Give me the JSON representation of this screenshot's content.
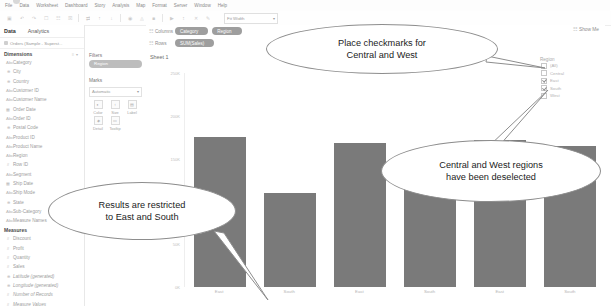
{
  "app": {
    "menu": [
      "File",
      "Data",
      "Worksheet",
      "Dashboard",
      "Story",
      "Analysis",
      "Map",
      "Format",
      "Server",
      "Window",
      "Help"
    ],
    "zoom_label": "Fit Width",
    "show_me": "Show Me",
    "show_me_icon": "grid-icon"
  },
  "left_panel": {
    "tab_data": "Data",
    "tab_analytics": "Analytics",
    "datasource": "Orders (Sample - Superst...",
    "dimensions_header": "Dimensions",
    "dimensions": [
      {
        "label": "Category",
        "icon": "abc-icon"
      },
      {
        "label": "City",
        "icon": "globe-icon"
      },
      {
        "label": "Country",
        "icon": "globe-icon"
      },
      {
        "label": "Customer ID",
        "icon": "abc-icon"
      },
      {
        "label": "Customer Name",
        "icon": "abc-icon"
      },
      {
        "label": "Order Date",
        "icon": "calendar-icon"
      },
      {
        "label": "Order ID",
        "icon": "abc-icon"
      },
      {
        "label": "Postal Code",
        "icon": "globe-icon"
      },
      {
        "label": "Product ID",
        "icon": "abc-icon"
      },
      {
        "label": "Product Name",
        "icon": "abc-icon"
      },
      {
        "label": "Region",
        "icon": "abc-icon"
      },
      {
        "label": "Row ID",
        "icon": "hash-icon"
      },
      {
        "label": "Segment",
        "icon": "abc-icon"
      },
      {
        "label": "Ship Date",
        "icon": "calendar-icon"
      },
      {
        "label": "Ship Mode",
        "icon": "abc-icon"
      },
      {
        "label": "State",
        "icon": "globe-icon"
      },
      {
        "label": "Sub-Category",
        "icon": "abc-icon"
      },
      {
        "label": "Measure Names",
        "icon": "abc-icon"
      }
    ],
    "measures_header": "Measures",
    "measures": [
      {
        "label": "Discount",
        "icon": "hash-icon",
        "italic": false
      },
      {
        "label": "Profit",
        "icon": "hash-icon",
        "italic": false
      },
      {
        "label": "Quantity",
        "icon": "hash-icon",
        "italic": false
      },
      {
        "label": "Sales",
        "icon": "hash-icon",
        "italic": false
      },
      {
        "label": "Latitude (generated)",
        "icon": "globe-icon",
        "italic": true
      },
      {
        "label": "Longitude (generated)",
        "icon": "globe-icon",
        "italic": true
      },
      {
        "label": "Number of Records",
        "icon": "hash-icon",
        "italic": true
      },
      {
        "label": "Measure Values",
        "icon": "hash-icon",
        "italic": true
      }
    ]
  },
  "filters_card": {
    "title": "Filters",
    "pills": [
      "Region"
    ]
  },
  "marks_card": {
    "title": "Marks",
    "type_selected": "Automatic",
    "type_icon": "bar-icon",
    "buttons": [
      {
        "label": "Color",
        "icon": "color-icon"
      },
      {
        "label": "Size",
        "icon": "size-icon"
      },
      {
        "label": "Label",
        "icon": "label-icon"
      },
      {
        "label": "Detail",
        "icon": "detail-icon"
      },
      {
        "label": "Tooltip",
        "icon": "tooltip-icon"
      }
    ]
  },
  "shelves": {
    "columns_label": "Columns",
    "rows_label": "Rows",
    "columns_pills": [
      "Category",
      "Region"
    ],
    "rows_pills": [
      "SUM(Sales)"
    ]
  },
  "view": {
    "sheet_title": "Sheet 1",
    "column_header": "Furniture"
  },
  "region_filter": {
    "title": "Region",
    "options": [
      {
        "label": "(All)",
        "checked": false
      },
      {
        "label": "Central",
        "checked": false
      },
      {
        "label": "East",
        "checked": true
      },
      {
        "label": "South",
        "checked": true
      },
      {
        "label": "West",
        "checked": false
      }
    ]
  },
  "callouts": [
    {
      "id": "callout-place-checkmarks",
      "text": "Place checkmarks for\nCentral and West"
    },
    {
      "id": "callout-deselected",
      "text": "Central and West regions\nhave been deselected"
    },
    {
      "id": "callout-results-restricted",
      "text": "Results are restricted\nto East and South"
    }
  ],
  "chart_data": {
    "type": "bar",
    "title": "Sheet 1",
    "xlabel": "",
    "ylabel": "SUM(Sales)",
    "column_header": "Furniture",
    "categories": [
      "East",
      "South",
      "East",
      "South",
      "East",
      "South"
    ],
    "values": [
      175000,
      110000,
      168000,
      148000,
      172000,
      165000
    ],
    "ylim": [
      0,
      250000
    ],
    "yticks": [
      {
        "value": 250000,
        "label": "250K"
      },
      {
        "value": 200000,
        "label": "200K"
      },
      {
        "value": 150000,
        "label": "150K"
      },
      {
        "value": 100000,
        "label": "100K"
      },
      {
        "value": 50000,
        "label": "50K"
      },
      {
        "value": 0,
        "label": "0K"
      }
    ],
    "grid": false,
    "legend": "none",
    "bar_color": "#7a7a7a"
  },
  "colors": {
    "bar": "#7a7a7a",
    "pill": "#9e9e9e",
    "filter_pill": "#bdbdbd",
    "callout_border": "#8d8d8d",
    "text": "#3c3c3c"
  }
}
